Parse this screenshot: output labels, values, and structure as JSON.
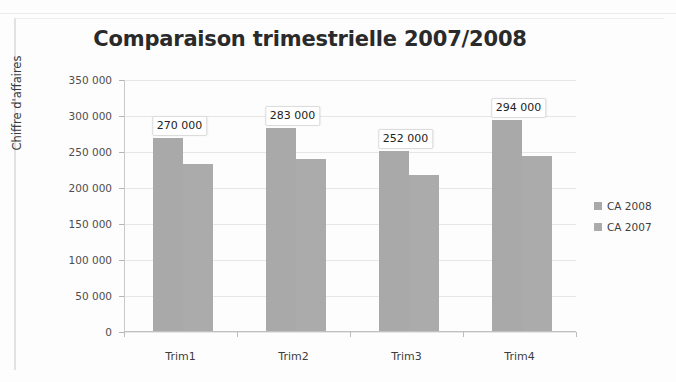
{
  "chart_data": {
    "type": "bar",
    "title": "Comparaison trimestrielle 2007/2008",
    "xlabel": "",
    "ylabel": "Chiffre d'affaires",
    "categories": [
      "Trim1",
      "Trim2",
      "Trim3",
      "Trim4"
    ],
    "series": [
      {
        "name": "CA 2008",
        "color": "#a9a9a9",
        "values": [
          270000,
          283000,
          252000,
          294000
        ],
        "data_labels": [
          "270 000",
          "283 000",
          "252 000",
          "294 000"
        ]
      },
      {
        "name": "CA 2007",
        "color": "#ababab",
        "values": [
          233000,
          240000,
          218000,
          245000
        ],
        "data_labels": [
          "",
          "",
          "",
          ""
        ]
      }
    ],
    "ylim": [
      0,
      350000
    ],
    "ytick_values": [
      0,
      50000,
      100000,
      150000,
      200000,
      250000,
      300000,
      350000
    ],
    "ytick_labels": [
      "0",
      "50 000",
      "100 000",
      "150 000",
      "200 000",
      "250 000",
      "300 000",
      "350 000"
    ],
    "grid": true,
    "legend_position": "right",
    "legend_entries": [
      "CA 2008",
      "CA 2007"
    ]
  }
}
